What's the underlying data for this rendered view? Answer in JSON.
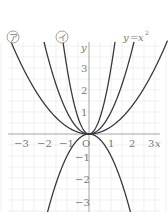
{
  "chart_data": {
    "type": "line",
    "title": "",
    "xlabel": "x",
    "ylabel": "y",
    "xlim": [
      -3.6,
      3.6
    ],
    "ylim": [
      -3.6,
      4.2
    ],
    "grid": true,
    "grid_step": 0.5,
    "x_ticks": [
      "-3",
      "-2",
      "-1",
      "1",
      "2",
      "3"
    ],
    "y_ticks": [
      "3",
      "2",
      "1",
      "-1",
      "-2",
      "-3"
    ],
    "origin_label": "O",
    "series": [
      {
        "name": "ア",
        "function": "y = (1/3)x^2",
        "coefficient": 0.3333
      },
      {
        "name": "イ",
        "function": "y = 3x^2",
        "coefficient": 3
      },
      {
        "name": "y=x²",
        "function": "y = x^2",
        "coefficient": 1
      },
      {
        "name": "(unlabeled)",
        "function": "y = -x^2",
        "coefficient": -1
      }
    ],
    "annotations": [
      {
        "text": "ア",
        "circled": true,
        "near": "outer-left curve top"
      },
      {
        "text": "イ",
        "circled": true,
        "near": "inner-left curve top"
      },
      {
        "text": "y=x²",
        "near": "middle-right curve top"
      }
    ]
  },
  "labels": {
    "a": "ア",
    "i": "イ",
    "eq_y": "y",
    "eq_eq": "=",
    "eq_x": "x",
    "eq_sup": "2",
    "x_axis": "x",
    "y_axis": "y",
    "origin": "O",
    "xt": [
      "−3",
      "−2",
      "−1",
      "1",
      "2",
      "3"
    ],
    "yt": [
      "3",
      "2",
      "1",
      "−1",
      "−2",
      "−3"
    ]
  },
  "colors": {
    "curve": "#3a3a3a",
    "axis": "#9a9a9a",
    "grid": "#e6e6e6",
    "text": "#777777"
  }
}
